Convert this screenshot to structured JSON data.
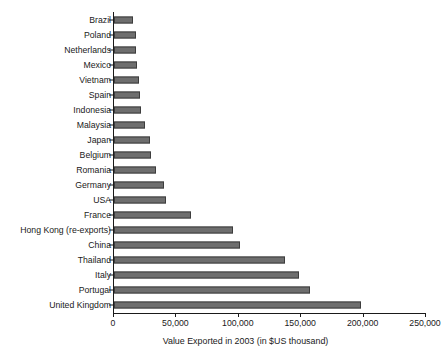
{
  "chart_data": {
    "type": "bar",
    "orientation": "horizontal",
    "title": "",
    "xlabel": "Value Exported in 2003 (in $US thousand)",
    "ylabel": "",
    "xlim": [
      0,
      250000
    ],
    "xticks": [
      0,
      50000,
      100000,
      150000,
      200000,
      250000
    ],
    "xtick_labels": [
      "0",
      "50,000",
      "100,000",
      "150,000",
      "200,000",
      "250,000"
    ],
    "grid": false,
    "legend": null,
    "bar_color": "#6e6e6e",
    "bar_edge_color": "#3d3d3d",
    "categories": [
      "Brazil",
      "Poland",
      "Netherlands",
      "Mexico",
      "Vietnam",
      "Spain",
      "Indonesia",
      "Malaysia",
      "Japan",
      "Belgium",
      "Romania",
      "Germany",
      "USA",
      "France",
      "Hong Kong (re-exports)",
      "China",
      "Thailand",
      "Italy",
      "Portugal",
      "United Kingdom"
    ],
    "values": [
      15000,
      17500,
      18000,
      18500,
      20000,
      21000,
      21500,
      25000,
      29000,
      29500,
      33500,
      40000,
      42000,
      62000,
      95000,
      101000,
      137000,
      148000,
      157000,
      198000
    ]
  }
}
